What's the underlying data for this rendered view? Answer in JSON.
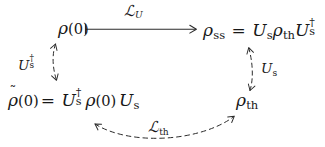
{
  "figure": {
    "type": "commutative-diagram",
    "domain_note": "quantum density-matrix commutative diagram",
    "background_color": "#ffffff",
    "stroke_color": "#2b2b2b"
  },
  "nodes": {
    "rho_0": {
      "id": "rho-0",
      "text": "ρ(0)",
      "rho": "ρ",
      "arg": "(0)",
      "position": "top-left"
    },
    "rho_ss": {
      "id": "rho-ss",
      "text": "ρss = UsρthUs†",
      "lhs_rho": "ρ",
      "lhs_sub": "ss",
      "equals": "=",
      "u_letter": "U",
      "u_sub": "s",
      "rho_th_rho": "ρ",
      "rho_th_sub": "th",
      "u2_letter": "U",
      "u2_sub": "s",
      "u2_sup": "†",
      "position": "top-right"
    },
    "rho_tilde_0": {
      "id": "rho-tilde-0",
      "text": "ρ̃(0)= Us† ρ(0) Us",
      "tilde": "˜",
      "rho": "ρ",
      "arg": "(0)",
      "equals": "=",
      "u_letter": "U",
      "u_sub": "s",
      "u_sup": "†",
      "mid_rho": "ρ",
      "mid_arg": "(0)",
      "u2_letter": "U",
      "u2_sub": "s",
      "position": "bottom-left"
    },
    "rho_th": {
      "id": "rho-th",
      "text": "ρth",
      "rho": "ρ",
      "sub": "th",
      "position": "bottom-right"
    }
  },
  "edges": {
    "top": {
      "id": "edge-lu",
      "label_script": "ℒ",
      "label_sub": "U",
      "label_text": "ℒU",
      "style": "solid",
      "tail": "bar",
      "head": "arrow",
      "from": "rho-0",
      "to": "rho-ss"
    },
    "left": {
      "id": "edge-us-dagger",
      "label_letter": "U",
      "label_sub": "s",
      "label_sup": "†",
      "label_text": "Us†",
      "style": "dashed",
      "head": "double",
      "from": "rho-0",
      "to": "rho-tilde-0"
    },
    "right": {
      "id": "edge-us",
      "label_letter": "U",
      "label_sub": "s",
      "label_text": "Us",
      "style": "dashed",
      "head": "double",
      "from": "rho-th",
      "to": "rho-ss"
    },
    "bottom": {
      "id": "edge-lth",
      "label_script": "ℒ",
      "label_sub": "th",
      "label_text": "ℒth",
      "style": "dashed",
      "head": "double",
      "from": "rho-tilde-0",
      "to": "rho-th"
    }
  }
}
